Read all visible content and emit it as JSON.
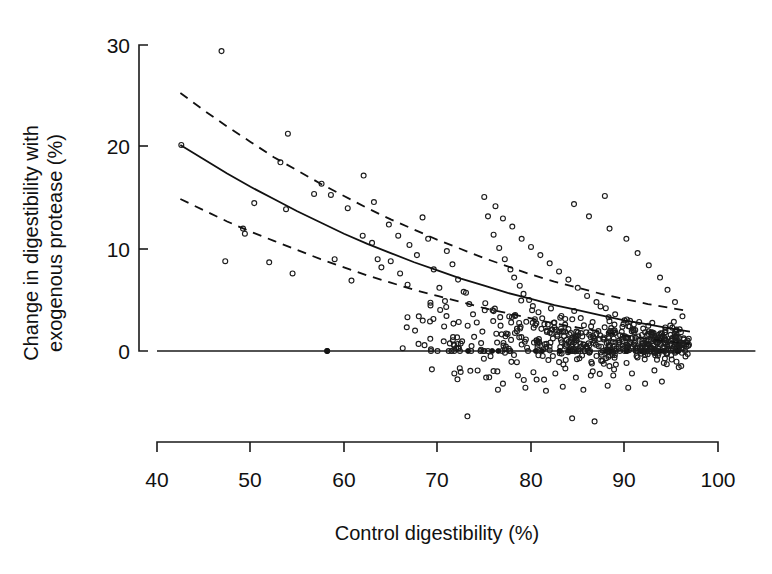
{
  "figure": {
    "type": "scatter-plot",
    "background": "#ffffff",
    "ink_color": "#111111"
  },
  "axes": {
    "x": {
      "label": "Control digestibility (%)",
      "ticks": [
        "40",
        "50",
        "60",
        "70",
        "80",
        "90",
        "100"
      ],
      "min": 40,
      "max": 100
    },
    "y": {
      "label_line1": "Change in digestibility with",
      "label_line2": "exogenous protease (%)",
      "ticks": [
        "0",
        "10",
        "20",
        "30"
      ],
      "min": 0,
      "max": 30
    }
  },
  "chart_data": {
    "type": "scatter",
    "title": "",
    "xlabel": "Control digestibility (%)",
    "ylabel": "Change in digestibility with exogenous protease (%)",
    "xlim": [
      40,
      100
    ],
    "ylim": [
      -8,
      30
    ],
    "x_ticks": [
      40,
      50,
      60,
      70,
      80,
      90,
      100
    ],
    "y_ticks": [
      0,
      10,
      20,
      30
    ],
    "grid": false,
    "legend": "none",
    "marker": "open-circle",
    "annotations": [
      "Solid curve = fitted exponential-decay regression",
      "Dashed curves = 95% confidence/prediction band",
      "Horizontal solid line at y = 0"
    ],
    "fit_curve": {
      "style": "solid",
      "x": [
        42.5,
        45,
        47.5,
        50,
        52.5,
        55,
        57.5,
        60,
        62.5,
        65,
        67.5,
        70,
        72.5,
        75,
        77.5,
        80,
        82.5,
        85,
        87.5,
        90,
        92.5,
        95,
        97
      ],
      "y": [
        20.2,
        18.8,
        17.4,
        16.1,
        14.9,
        13.7,
        12.6,
        11.5,
        10.5,
        9.6,
        8.7,
        7.9,
        7.1,
        6.4,
        5.7,
        5.1,
        4.5,
        4.0,
        3.5,
        3.0,
        2.6,
        2.2,
        1.9
      ]
    },
    "ci_upper": {
      "style": "dashed",
      "x": [
        42.5,
        45,
        47.5,
        50,
        52.5,
        55,
        57.5,
        60,
        62.5,
        65,
        67.5,
        70,
        72.5,
        75,
        77.5,
        80,
        82.5,
        85,
        87.5,
        90,
        92.5,
        95,
        97
      ],
      "y": [
        25.3,
        23.6,
        22.0,
        20.5,
        19.0,
        17.7,
        16.4,
        15.2,
        14.0,
        12.9,
        11.9,
        10.9,
        10.0,
        9.1,
        8.3,
        7.5,
        6.8,
        6.2,
        5.6,
        5.1,
        4.6,
        4.2,
        3.9
      ]
    },
    "ci_lower": {
      "style": "dashed",
      "x": [
        42.5,
        45,
        47.5,
        50,
        52.5,
        55,
        57.5,
        60,
        62.5,
        65,
        67.5,
        70,
        72.5,
        75,
        77.5,
        80,
        82.5,
        85,
        87.5,
        90,
        92.5,
        95,
        97
      ],
      "y": [
        14.9,
        13.8,
        12.7,
        11.7,
        10.8,
        9.9,
        9.0,
        8.2,
        7.4,
        6.7,
        6.0,
        5.4,
        4.8,
        4.2,
        3.7,
        3.2,
        2.7,
        2.3,
        1.9,
        1.5,
        1.2,
        0.9,
        0.7
      ]
    },
    "zero_line": {
      "y": 0,
      "x_start": 40,
      "x_end": 104
    },
    "n_points": 640,
    "notable_points": [
      {
        "x": 46.9,
        "y": 29.4,
        "note": "top outlier"
      },
      {
        "x": 42.6,
        "y": 20.2,
        "note": "leftmost point, on fitted curve start"
      },
      {
        "x": 54.0,
        "y": 21.3
      },
      {
        "x": 53.2,
        "y": 18.5
      },
      {
        "x": 58.2,
        "y": 0.0,
        "note": "filled point on zero line"
      },
      {
        "x": 87.9,
        "y": 15.2,
        "note": "isolated high point at right"
      },
      {
        "x": 73.2,
        "y": -6.4,
        "note": "low outlier"
      },
      {
        "x": 86.8,
        "y": -6.9,
        "note": "low outlier"
      }
    ],
    "points": [
      [
        46.9,
        29.4
      ],
      [
        42.6,
        20.2
      ],
      [
        54.0,
        21.3
      ],
      [
        53.2,
        18.5
      ],
      [
        57.6,
        16.4
      ],
      [
        56.8,
        15.4
      ],
      [
        58.6,
        15.3
      ],
      [
        60.4,
        14.0
      ],
      [
        62.1,
        17.2
      ],
      [
        63.2,
        14.6
      ],
      [
        50.4,
        14.5
      ],
      [
        53.8,
        13.9
      ],
      [
        49.2,
        12.0
      ],
      [
        49.4,
        11.5
      ],
      [
        47.3,
        8.8
      ],
      [
        52.0,
        8.7
      ],
      [
        54.5,
        7.6
      ],
      [
        59.0,
        9.0
      ],
      [
        60.8,
        6.9
      ],
      [
        58.2,
        0.0
      ],
      [
        62.0,
        11.3
      ],
      [
        63.0,
        10.6
      ],
      [
        63.6,
        9.0
      ],
      [
        64.0,
        8.2
      ],
      [
        65.0,
        8.8
      ],
      [
        66.0,
        7.6
      ],
      [
        66.8,
        6.5
      ],
      [
        64.8,
        12.4
      ],
      [
        65.8,
        11.3
      ],
      [
        67.0,
        10.4
      ],
      [
        67.8,
        9.4
      ],
      [
        68.4,
        13.1
      ],
      [
        69.0,
        11.0
      ],
      [
        69.6,
        8.0
      ],
      [
        70.2,
        6.2
      ],
      [
        70.8,
        4.9
      ],
      [
        68.0,
        3.4
      ],
      [
        69.2,
        2.9
      ],
      [
        67.6,
        2.0
      ],
      [
        71.0,
        9.8
      ],
      [
        71.6,
        8.5
      ],
      [
        72.2,
        7.0
      ],
      [
        72.8,
        5.8
      ],
      [
        73.4,
        4.6
      ],
      [
        73.8,
        3.6
      ],
      [
        74.2,
        2.8
      ],
      [
        74.8,
        1.9
      ],
      [
        70.0,
        0.0
      ],
      [
        71.2,
        0.0
      ],
      [
        72.4,
        0.0
      ],
      [
        73.6,
        0.0
      ],
      [
        74.6,
        0.0
      ],
      [
        75.4,
        13.2
      ],
      [
        76.0,
        11.4
      ],
      [
        76.6,
        10.1
      ],
      [
        77.2,
        9.0
      ],
      [
        77.8,
        8.0
      ],
      [
        78.2,
        7.2
      ],
      [
        78.8,
        6.4
      ],
      [
        79.2,
        5.6
      ],
      [
        79.8,
        5.0
      ],
      [
        80.2,
        4.4
      ],
      [
        80.8,
        3.8
      ],
      [
        81.2,
        3.2
      ],
      [
        81.8,
        2.6
      ],
      [
        82.2,
        2.1
      ],
      [
        82.8,
        1.6
      ],
      [
        83.2,
        1.1
      ],
      [
        83.8,
        0.6
      ],
      [
        84.2,
        0.0
      ],
      [
        75.0,
        15.1
      ],
      [
        76.2,
        14.2
      ],
      [
        77.0,
        13.0
      ],
      [
        78.0,
        12.2
      ],
      [
        79.0,
        11.0
      ],
      [
        80.0,
        10.2
      ],
      [
        81.0,
        9.4
      ],
      [
        82.0,
        8.6
      ],
      [
        83.0,
        7.8
      ],
      [
        84.0,
        7.0
      ],
      [
        85.0,
        6.2
      ],
      [
        86.0,
        5.4
      ],
      [
        87.0,
        4.8
      ],
      [
        88.0,
        4.2
      ],
      [
        89.0,
        3.6
      ],
      [
        90.0,
        3.0
      ],
      [
        91.0,
        2.6
      ],
      [
        92.0,
        2.2
      ],
      [
        93.0,
        1.8
      ],
      [
        94.0,
        1.4
      ],
      [
        95.0,
        1.0
      ],
      [
        96.0,
        0.6
      ],
      [
        87.9,
        15.2
      ],
      [
        84.6,
        14.4
      ],
      [
        86.2,
        13.2
      ],
      [
        88.4,
        12.0
      ],
      [
        90.2,
        11.0
      ],
      [
        91.4,
        9.6
      ],
      [
        92.6,
        8.4
      ],
      [
        93.8,
        7.2
      ],
      [
        94.6,
        6.0
      ],
      [
        95.4,
        4.8
      ],
      [
        96.2,
        3.4
      ],
      [
        73.2,
        -6.4
      ],
      [
        86.8,
        -6.9
      ],
      [
        84.4,
        -6.6
      ],
      [
        77.0,
        -3.2
      ],
      [
        79.4,
        -3.6
      ],
      [
        81.6,
        -3.9
      ],
      [
        83.4,
        -3.5
      ],
      [
        85.6,
        -3.8
      ],
      [
        88.2,
        -3.4
      ],
      [
        90.4,
        -3.6
      ],
      [
        92.2,
        -3.2
      ],
      [
        94.0,
        -3.0
      ],
      [
        69.4,
        -1.8
      ],
      [
        71.8,
        -2.2
      ],
      [
        75.2,
        -2.6
      ],
      [
        76.4,
        -2.0
      ],
      [
        78.6,
        -2.4
      ],
      [
        80.6,
        -2.8
      ],
      [
        82.6,
        -2.2
      ],
      [
        84.8,
        -2.6
      ],
      [
        86.6,
        -2.0
      ],
      [
        88.8,
        -2.4
      ],
      [
        90.8,
        -2.2
      ],
      [
        93.2,
        -1.9
      ],
      [
        95.8,
        -1.6
      ]
    ]
  }
}
